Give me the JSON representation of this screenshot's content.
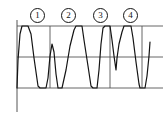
{
  "figure": {
    "title": "",
    "background_color": "#ffffff",
    "line_color": "#141414",
    "grid_color": "#555555",
    "width": 167,
    "height": 120
  },
  "markers": [
    {
      "id": "marker-1",
      "label": "1",
      "x": 30,
      "y": 8
    },
    {
      "id": "marker-2",
      "label": "2",
      "x": 61,
      "y": 8
    },
    {
      "id": "marker-3",
      "label": "3",
      "x": 93,
      "y": 8
    },
    {
      "id": "marker-4",
      "label": "4",
      "x": 123,
      "y": 8
    }
  ],
  "chart_data": {
    "type": "line",
    "title": "",
    "xlabel": "",
    "ylabel": "",
    "xlim": [
      0,
      150
    ],
    "ylim": [
      -1.6,
      1.6
    ],
    "grid": true,
    "legend_position": "none",
    "reference_lines": {
      "zero_line_y": 0,
      "clip_high_y": 1.0,
      "clip_low_y": -1.0
    },
    "axis_lines": {
      "vertical_axis_x_px": 17,
      "vertical_axis_top_px": 20,
      "vertical_axis_bottom_px": 112,
      "top_gridline_y_px": 26,
      "middle_gridline_y_px": 57,
      "bottom_gridline_y_px": 88,
      "vertical_gridlines_x_px": [
        50,
        110,
        142
      ]
    },
    "series": [
      {
        "name": "clipped-waveform",
        "color": "#141414",
        "points_px": [
          [
            17,
            88
          ],
          [
            18,
            60
          ],
          [
            20,
            34
          ],
          [
            22,
            26
          ],
          [
            28,
            26
          ],
          [
            31,
            34
          ],
          [
            34,
            58
          ],
          [
            38,
            86
          ],
          [
            40,
            88
          ],
          [
            46,
            88
          ],
          [
            48,
            78
          ],
          [
            50,
            56
          ],
          [
            52,
            44
          ],
          [
            54,
            52
          ],
          [
            56,
            74
          ],
          [
            58,
            88
          ],
          [
            62,
            88
          ],
          [
            66,
            70
          ],
          [
            70,
            46
          ],
          [
            74,
            30
          ],
          [
            76,
            26
          ],
          [
            82,
            26
          ],
          [
            84,
            40
          ],
          [
            88,
            66
          ],
          [
            91,
            86
          ],
          [
            93,
            88
          ],
          [
            97,
            88
          ],
          [
            99,
            70
          ],
          [
            101,
            44
          ],
          [
            103,
            28
          ],
          [
            105,
            26
          ],
          [
            110,
            26
          ],
          [
            112,
            40
          ],
          [
            114,
            56
          ],
          [
            116,
            70
          ],
          [
            117,
            58
          ],
          [
            119,
            44
          ],
          [
            122,
            32
          ],
          [
            124,
            26
          ],
          [
            131,
            26
          ],
          [
            133,
            38
          ],
          [
            136,
            62
          ],
          [
            139,
            84
          ],
          [
            140,
            88
          ],
          [
            145,
            88
          ],
          [
            147,
            76
          ],
          [
            149,
            56
          ],
          [
            150,
            42
          ]
        ]
      }
    ]
  }
}
